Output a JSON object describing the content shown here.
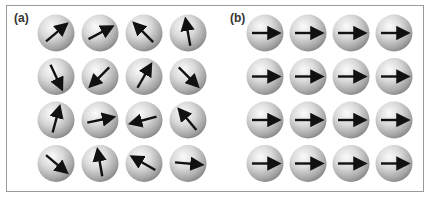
{
  "figure": {
    "panels": [
      {
        "label": "(a)",
        "description": "random spin orientations",
        "origin_x": 56,
        "origin_y": 33,
        "dx": 44,
        "dy": 43.5,
        "angles": [
          [
            40,
            28,
            135,
            100
          ],
          [
            -65,
            -135,
            60,
            -45
          ],
          [
            75,
            12,
            195,
            130
          ],
          [
            -40,
            100,
            150,
            -5
          ]
        ]
      },
      {
        "label": "(b)",
        "description": "aligned spin orientations",
        "origin_x": 265,
        "origin_y": 33,
        "dx": 43,
        "dy": 43.5,
        "angles": [
          [
            0,
            0,
            0,
            0
          ],
          [
            0,
            0,
            0,
            0
          ],
          [
            0,
            0,
            0,
            0
          ],
          [
            0,
            0,
            0,
            0
          ]
        ]
      }
    ],
    "colors": {
      "border": "#9a9a9a",
      "arrow": "#111111",
      "sphere_light": "#f4f4f4",
      "sphere_dark": "#8e8e8e"
    },
    "sphere_radius": 18.5,
    "arrow_length": 26
  }
}
